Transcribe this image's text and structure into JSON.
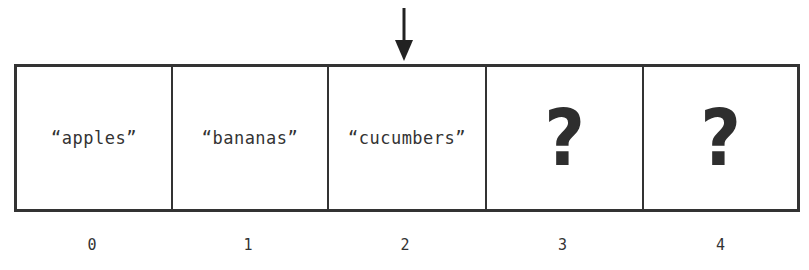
{
  "diagram": {
    "type": "array",
    "pointer": {
      "icon": "down-arrow-icon",
      "points_to_index": 2,
      "color": "#222222"
    },
    "cells": [
      {
        "index_label": "0",
        "value": "“apples”",
        "kind": "string",
        "width": 156
      },
      {
        "index_label": "1",
        "value": "“bananas”",
        "kind": "string",
        "width": 156
      },
      {
        "index_label": "2",
        "value": "“cucumbers”",
        "kind": "string",
        "width": 158
      },
      {
        "index_label": "3",
        "value": "?",
        "kind": "unknown",
        "width": 157
      },
      {
        "index_label": "4",
        "value": "?",
        "kind": "unknown",
        "width": 159
      }
    ],
    "colors": {
      "border": "#333333",
      "text": "#333333",
      "background": "#ffffff"
    }
  }
}
